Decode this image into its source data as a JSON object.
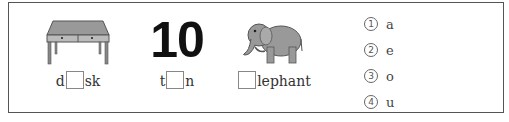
{
  "items": [
    {
      "picture": "desk-image",
      "prefix": "d",
      "suffix": "sk"
    },
    {
      "picture": "number-10",
      "number": "10",
      "prefix": "t",
      "suffix": "n"
    },
    {
      "picture": "elephant-image",
      "prefix": "",
      "suffix": "lephant"
    }
  ],
  "choices": [
    {
      "mark": "1",
      "letter": "a"
    },
    {
      "mark": "2",
      "letter": "e"
    },
    {
      "mark": "3",
      "letter": "o"
    },
    {
      "mark": "4",
      "letter": "u"
    }
  ]
}
